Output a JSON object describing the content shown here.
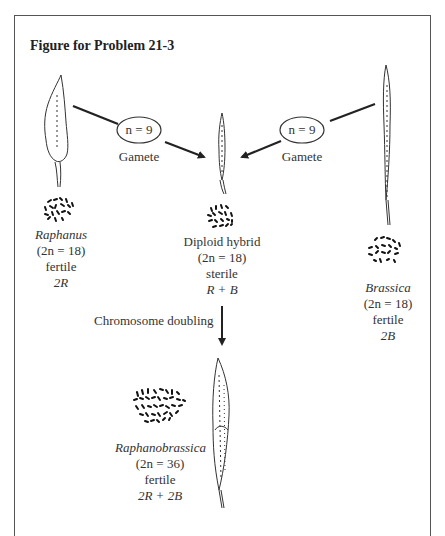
{
  "figure": {
    "title": "Figure for Problem 21-3"
  },
  "gametes": [
    {
      "oval_label": "n = 9",
      "caption": "Gamete"
    },
    {
      "oval_label": "n = 9",
      "caption": "Gamete"
    }
  ],
  "raphanus": {
    "name": "Raphanus",
    "chromosomes": "(2n = 18)",
    "fertility": "fertile",
    "genome": "2R"
  },
  "hybrid": {
    "name": "Diploid hybrid",
    "chromosomes": "(2n = 18)",
    "fertility": "sterile",
    "genome": "R + B"
  },
  "brassica": {
    "name": "Brassica",
    "chromosomes": "(2n = 18)",
    "fertility": "fertile",
    "genome": "2B"
  },
  "doubling": {
    "label": "Chromosome doubling"
  },
  "raphanobrassica": {
    "name": "Raphanobrassica",
    "chromosomes": "(2n = 36)",
    "fertility": "fertile",
    "genome": "2R + 2B"
  }
}
